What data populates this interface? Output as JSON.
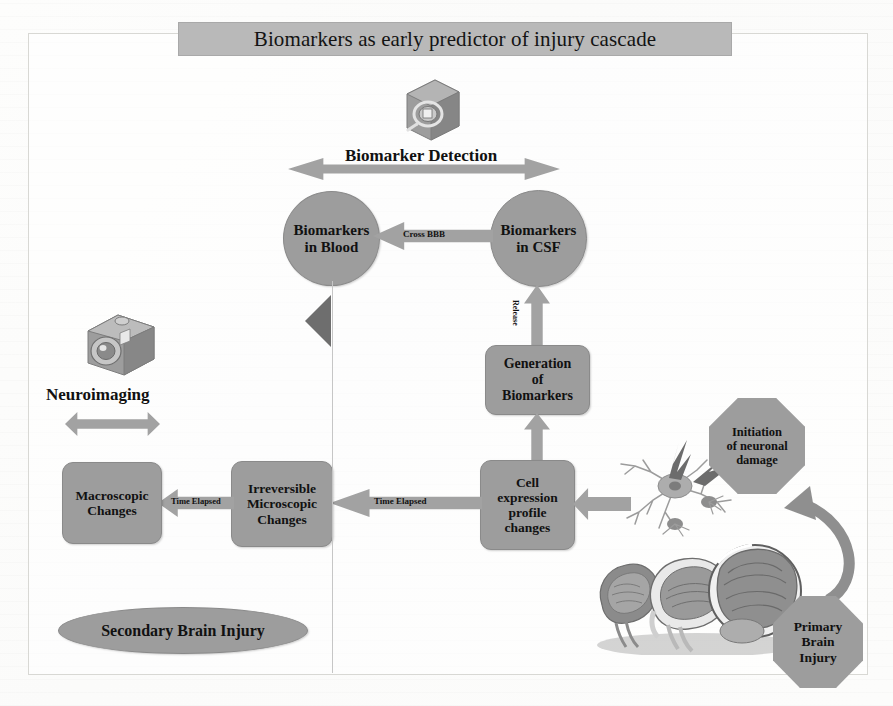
{
  "figure": {
    "title": "Biomarkers as early predictor of injury cascade"
  },
  "colors": {
    "node_fill": "#9d9d9d",
    "node_stroke": "#8a8a8a",
    "arrow_fill": "#a2a2a2",
    "banner_fill": "#b9b9b9",
    "triangle_fill": "#6e6e6e",
    "page_bg": "#ffffff",
    "text": "#111111"
  },
  "headers": {
    "biomarker_detection": "Biomarker Detection",
    "neuroimaging": "Neuroimaging"
  },
  "icons": {
    "magnifier_box": "magnifier-box-icon",
    "camera": "camera-icon",
    "neuron": "neuron-icon",
    "brains": "brain-sections-icon"
  },
  "nodes": {
    "biomarkers_blood": "Biomarkers\nin Blood",
    "biomarkers_blood_line1": "Biomarkers",
    "biomarkers_blood_line2": "in Blood",
    "biomarkers_csf_line1": "Biomarkers",
    "biomarkers_csf_line2": "in CSF",
    "generation_line1": "Generation",
    "generation_line2": "of",
    "generation_line3": "Biomarkers",
    "cell_line1": "Cell",
    "cell_line2": "expression",
    "cell_line3": "profile",
    "cell_line4": "changes",
    "irreversible_line1": "Irreversible",
    "irreversible_line2": "Microscopic",
    "irreversible_line3": "Changes",
    "macroscopic_line1": "Macroscopic",
    "macroscopic_line2": "Changes",
    "initiation_line1": "Initiation",
    "initiation_line2": "of neuronal",
    "initiation_line3": "damage",
    "primary_line1": "Primary",
    "primary_line2": "Brain",
    "primary_line3": "Injury",
    "secondary": "Secondary Brain Injury"
  },
  "edge_labels": {
    "cross_bbb": "Cross BBB",
    "release": "Release",
    "time_elapsed_1": "Time Elapsed",
    "time_elapsed_2": "Time Elapsed"
  }
}
